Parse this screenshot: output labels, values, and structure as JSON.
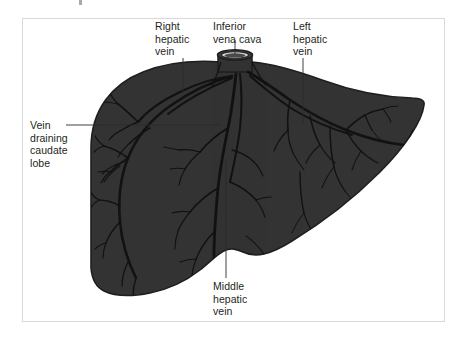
{
  "figure": {
    "background_color": "#ffffff",
    "frame_border_color": "#d9d9d9",
    "organ_fill_color": "#333333",
    "organ_outline_color": "#1a1a1a",
    "vessel_line_color": "#111111",
    "leader_line_color": "#2b2b2b",
    "label_text_color": "#231f20",
    "ivc_rim_color": "#e8e8e8"
  },
  "labels": {
    "right_hepatic_vein": "Right\nhepatic\nvein",
    "inferior_vena_cava": "Inferior\nvena cava",
    "left_hepatic_vein": "Left\nhepatic\nvein",
    "vein_draining_caudate_lobe": "Vein\ndraining\ncaudate\nlobe",
    "middle_hepatic_vein": "Middle\nhepatic\nvein"
  },
  "structures": [
    {
      "name": "liver",
      "kind": "organ-silhouette"
    },
    {
      "name": "inferior-vena-cava",
      "kind": "vessel-stump"
    },
    {
      "name": "right-hepatic-vein",
      "kind": "vein-tree"
    },
    {
      "name": "middle-hepatic-vein",
      "kind": "vein-tree"
    },
    {
      "name": "left-hepatic-vein",
      "kind": "vein-tree"
    },
    {
      "name": "caudate-lobe-vein",
      "kind": "vein-tree"
    }
  ]
}
